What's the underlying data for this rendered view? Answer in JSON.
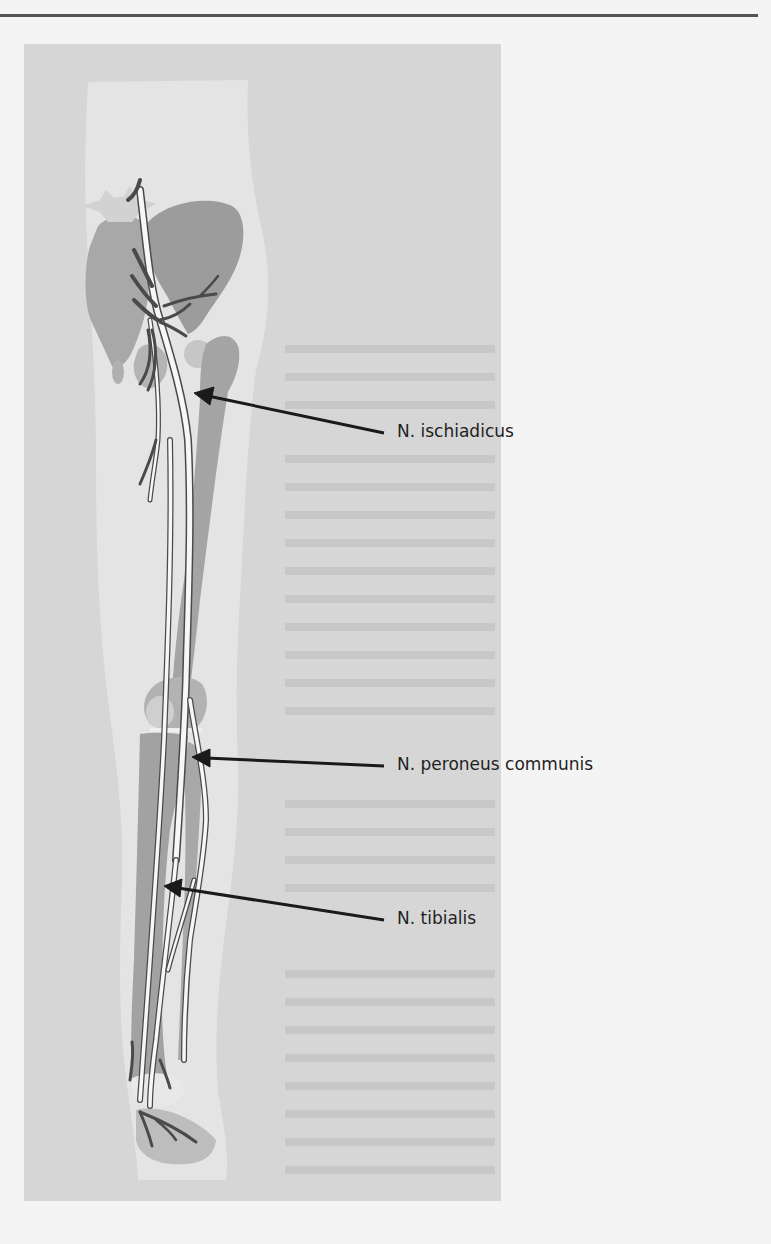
{
  "page": {
    "background": "#f4f4f4",
    "figure_background": "#d6d6d6"
  },
  "figure": {
    "labels": [
      {
        "id": "ischiadicus",
        "text": "N. ischiadicus"
      },
      {
        "id": "peroneus",
        "text": "N. peroneus communis"
      },
      {
        "id": "tibialis",
        "text": "N. tibialis"
      }
    ],
    "colors": {
      "bone": "#9a9a9a",
      "bone_light": "#c8c8c8",
      "skin": "#e6e6e6",
      "nerve_fill": "#f7f7f7",
      "nerve_outline": "#4a4a4a",
      "arrow": "#1a1a1a"
    }
  }
}
